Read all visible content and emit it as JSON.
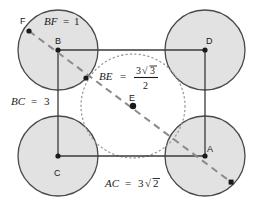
{
  "figure": {
    "background_color": "#ffffff"
  },
  "style": {
    "circle_fill": "#e2e2e2",
    "circle_stroke": "#4a4a4a",
    "square_stroke": "#3a3a3a",
    "dashed_stroke": "#8a8a8a",
    "dotted_stroke": "#9a9a9a",
    "point_fill": "#1a1a1a",
    "text_color": "#1a1a1a"
  },
  "square": {
    "name": "ABDC",
    "vertices": [
      {
        "id": "B",
        "label": "B",
        "x": 58,
        "y": 50,
        "label_x": 56,
        "label_y": 43
      },
      {
        "id": "D",
        "label": "D",
        "x": 205,
        "y": 50,
        "label_x": 207,
        "label_y": 43
      },
      {
        "id": "A",
        "label": "A",
        "x": 205,
        "y": 156,
        "label_x": 208,
        "label_y": 150
      },
      {
        "id": "C",
        "label": "C",
        "x": 58,
        "y": 156,
        "label_x": 55,
        "label_y": 173
      }
    ]
  },
  "circles": [
    {
      "id": "circle-B",
      "cx": 58,
      "cy": 50,
      "r": 40
    },
    {
      "id": "circle-D",
      "cx": 205,
      "cy": 50,
      "r": 40
    },
    {
      "id": "circle-A",
      "cx": 205,
      "cy": 156,
      "r": 40
    },
    {
      "id": "circle-C",
      "cx": 58,
      "cy": 156,
      "r": 40
    }
  ],
  "inner_circle": {
    "id": "dotted-inscribed-circle",
    "cx": 133,
    "cy": 106,
    "r": 52
  },
  "points": [
    {
      "id": "F",
      "label": "F",
      "x": 29,
      "y": 31,
      "label_x": 20,
      "label_y": 20
    },
    {
      "id": "BE-intersection",
      "label": "",
      "x": 86,
      "y": 78
    },
    {
      "id": "E",
      "label": "E",
      "x": 133,
      "y": 106,
      "label_x": 130,
      "label_y": 98
    },
    {
      "id": "G",
      "label": "",
      "x": 231,
      "y": 182
    }
  ],
  "dashed_line": {
    "id": "diagonal-FG",
    "from": {
      "x": 29,
      "y": 31
    },
    "to": {
      "x": 231,
      "y": 182
    }
  },
  "labels": {
    "bf": {
      "lhs": "BF",
      "eq": "=",
      "rhs": "1",
      "x": 44,
      "y": 24
    },
    "bc": {
      "lhs": "BC",
      "eq": "=",
      "rhs": "3",
      "x": 10,
      "y": 104
    },
    "ac": {
      "lhs": "AC",
      "eq": "=",
      "rhs": "3",
      "radical": "√",
      "radicand": "2",
      "x": 104,
      "y": 186
    },
    "be": {
      "lhs": "BE",
      "eq": "=",
      "numerator_coeff": "3",
      "numerator_radical": "√",
      "numerator_radicand": "3",
      "denominator": "2",
      "x": 98,
      "y": 76
    }
  },
  "measurements": {
    "BF": 1,
    "BC": 3,
    "AC": "3√2",
    "BE": "3√3 / 2"
  }
}
